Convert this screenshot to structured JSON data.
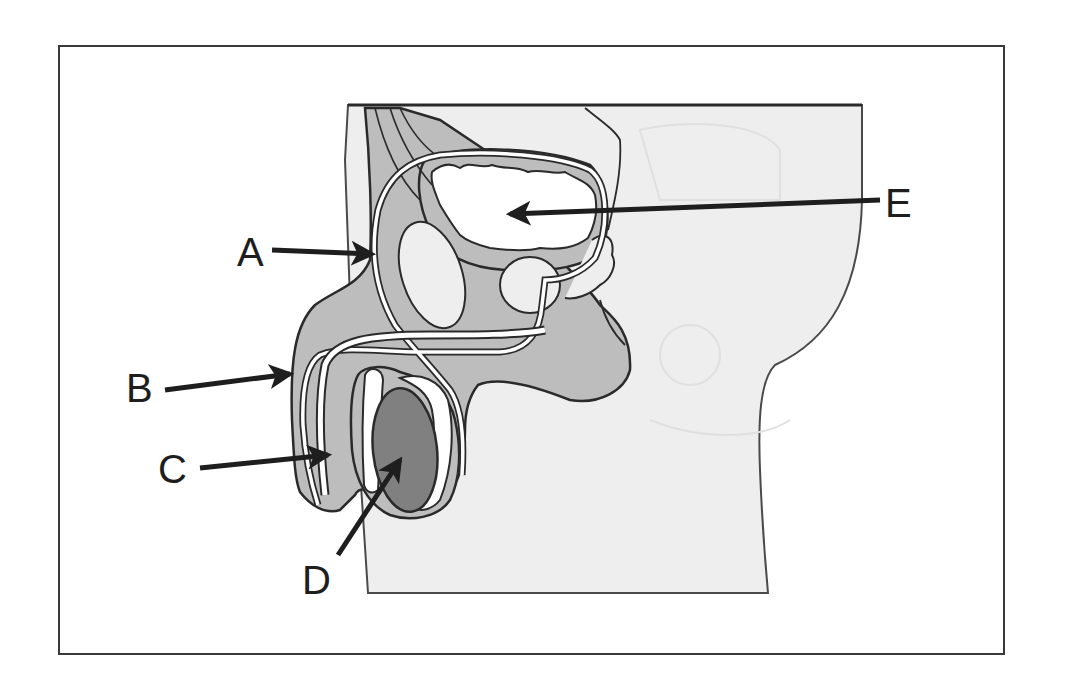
{
  "figure": {
    "type": "anatomical-diagram"
  },
  "labels": [
    {
      "id": "A",
      "text": "A",
      "points_to": "vas deferens (ascending segment)"
    },
    {
      "id": "B",
      "text": "B",
      "points_to": "penis"
    },
    {
      "id": "C",
      "text": "C",
      "points_to": "urethra"
    },
    {
      "id": "D",
      "text": "D",
      "points_to": "testis"
    },
    {
      "id": "E",
      "text": "E",
      "points_to": "urinary bladder"
    }
  ],
  "colors": {
    "frame": "#3a3a3a",
    "body_fill": "#eeeeee",
    "tissue_fill": "#bdbdbd",
    "testis_fill": "#808080",
    "outline": "#2a2a2a",
    "arrow": "#1e1e1e",
    "lumen": "#ffffff"
  }
}
